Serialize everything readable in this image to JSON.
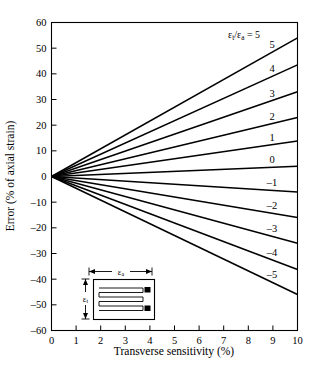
{
  "chart_data": {
    "type": "line",
    "title": "",
    "xlabel": "Transverse sensitivity (%)",
    "ylabel": "Error (% of axial strain)",
    "xlim": [
      0,
      10
    ],
    "ylim": [
      -60,
      60
    ],
    "xticks": [
      0,
      1,
      2,
      3,
      4,
      5,
      6,
      7,
      8,
      9,
      10
    ],
    "yticks": [
      60,
      50,
      40,
      30,
      20,
      10,
      0,
      -10,
      -20,
      -30,
      -40,
      -50,
      -60
    ],
    "grid": false,
    "legend_position": "inline-right-of-each-line",
    "legend_header": "εt/εa = 5",
    "x": [
      0,
      10
    ],
    "series": [
      {
        "name": "5",
        "label": "5",
        "values": [
          0,
          54.0
        ]
      },
      {
        "name": "4",
        "label": "4",
        "values": [
          0,
          43.5
        ]
      },
      {
        "name": "3",
        "label": "3",
        "values": [
          0,
          33.0
        ]
      },
      {
        "name": "2",
        "label": "2",
        "values": [
          0,
          23.0
        ]
      },
      {
        "name": "1",
        "label": "1",
        "values": [
          0,
          13.8
        ]
      },
      {
        "name": "0",
        "label": "0",
        "values": [
          0,
          4.0
        ]
      },
      {
        "name": "-1",
        "label": "–1",
        "values": [
          0,
          -6.0
        ]
      },
      {
        "name": "-2",
        "label": "–2",
        "values": [
          0,
          -16.0
        ]
      },
      {
        "name": "-3",
        "label": "–3",
        "values": [
          0,
          -26.0
        ]
      },
      {
        "name": "-4",
        "label": "–4",
        "values": [
          0,
          -36.2
        ]
      },
      {
        "name": "-5",
        "label": "–5",
        "values": [
          0,
          -46.0
        ]
      }
    ],
    "annotations": {
      "ratio_symbol_epsilon": "ε",
      "ratio_sub_t": "t",
      "ratio_sub_a": "a",
      "ratio_equals": "/",
      "equals_sign": "=",
      "top_series_value": "5"
    }
  },
  "axes": {
    "x": {
      "label": "Transverse sensitivity (%)",
      "tick_labels": [
        "0",
        "1",
        "2",
        "3",
        "4",
        "5",
        "6",
        "7",
        "8",
        "9",
        "10"
      ]
    },
    "y": {
      "label": "Error (% of axial strain)",
      "tick_labels": [
        "60",
        "50",
        "40",
        "30",
        "20",
        "10",
        "0",
        "–10",
        "–20",
        "–30",
        "–40",
        "–50",
        "–60"
      ]
    }
  },
  "inset": {
    "name": "strain-gauge-diagram",
    "horizontal_dim_label_symbol": "ε",
    "horizontal_dim_label_sub": "a",
    "vertical_dim_label_symbol": "ε",
    "vertical_dim_label_sub": "t"
  },
  "colors": {
    "background": "#ffffff",
    "ink": "#000000",
    "line": "#000000"
  }
}
